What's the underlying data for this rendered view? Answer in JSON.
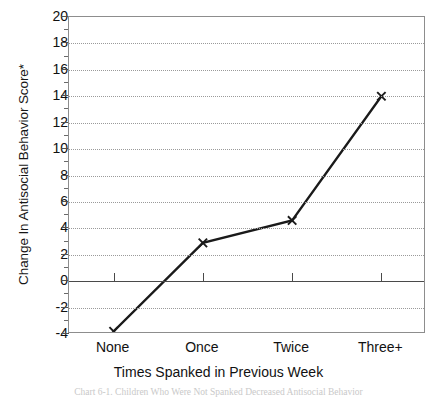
{
  "chart_data": {
    "type": "line",
    "title": "",
    "xlabel": "Times Spanked in Previous Week",
    "ylabel": "Change In Antisocial Behavior Score*",
    "categories": [
      "None",
      "Once",
      "Twice",
      "Three+"
    ],
    "values": [
      -3.8,
      2.9,
      4.6,
      14.0
    ],
    "series": [
      {
        "name": "Change In Antisocial Behavior Score",
        "values": [
          -3.8,
          2.9,
          4.6,
          14.0
        ]
      }
    ],
    "ylim": [
      -4,
      20
    ],
    "ytick_labels": [
      "20",
      "18",
      "16",
      "14",
      "12",
      "10",
      "8",
      "6",
      "4",
      "2",
      "0",
      "-2",
      "-4"
    ],
    "ytick_values": [
      20,
      18,
      16,
      14,
      12,
      10,
      8,
      6,
      4,
      2,
      0,
      -2,
      -4
    ],
    "ytick_minor_step": 1,
    "grid": true,
    "grid_style": "dotted",
    "legend": "none",
    "marker": "x-cross",
    "zero_line": 0,
    "line_color": "#1a1a1a",
    "grid_color": "#9a9a9a",
    "axis_color": "#8d8d8d"
  },
  "figure": {
    "caption": "Chart 6-1.  Children Who Were Not Spanked Decreased Antisocial Behavior"
  }
}
